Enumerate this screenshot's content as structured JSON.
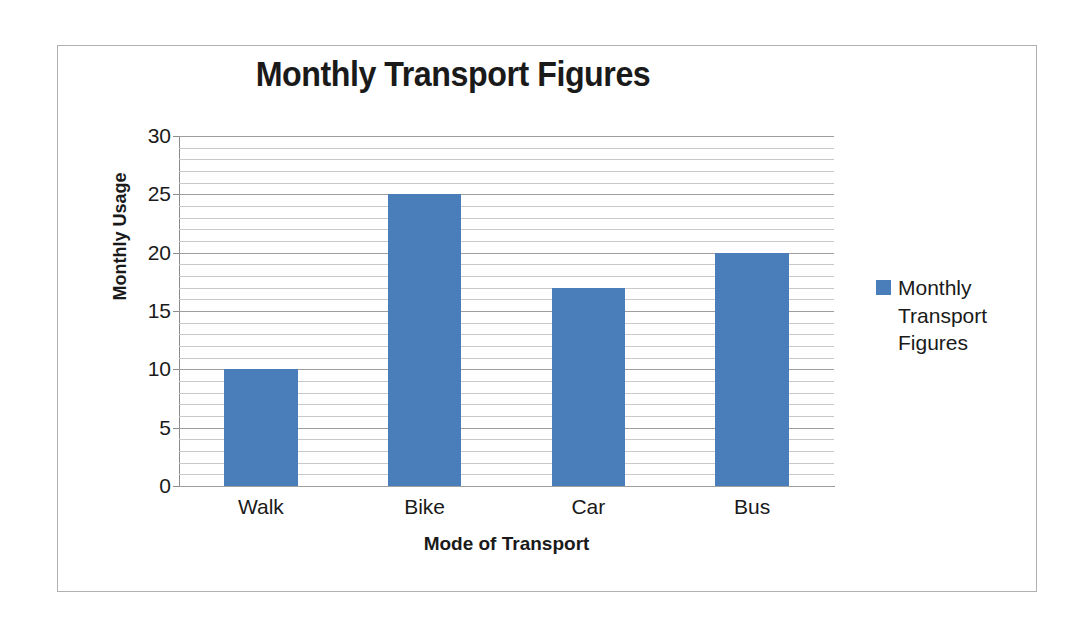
{
  "chart_data": {
    "type": "bar",
    "title": "Monthly Transport Figures",
    "xlabel": "Mode of Transport",
    "ylabel": "Monthly Usage",
    "categories": [
      "Walk",
      "Bike",
      "Car",
      "Bus"
    ],
    "values": [
      10,
      25,
      17,
      20
    ],
    "series": [
      {
        "name": "Monthly Transport Figures",
        "values": [
          10,
          25,
          17,
          20
        ]
      }
    ],
    "ylim": [
      0,
      30
    ],
    "y_major_ticks": [
      0,
      5,
      10,
      15,
      20,
      25,
      30
    ],
    "y_tick_labels": [
      "0",
      "5",
      "10",
      "15",
      "20",
      "25",
      "30"
    ],
    "y_minor_interval": 1,
    "grid": "horizontal-major-and-minor",
    "legend": {
      "position": "right",
      "entries": [
        {
          "label": "Monthly Transport Figures",
          "color": "#4a7ebb"
        }
      ]
    },
    "colors": {
      "bar": "#4a7ebb",
      "gridline_minor": "#c9c9c9",
      "gridline_major": "#9e9e9e",
      "axis_line": "#8c8c8c",
      "text": "#1a1a1a",
      "frame_border": "#b0b0b0",
      "background": "#ffffff"
    }
  }
}
